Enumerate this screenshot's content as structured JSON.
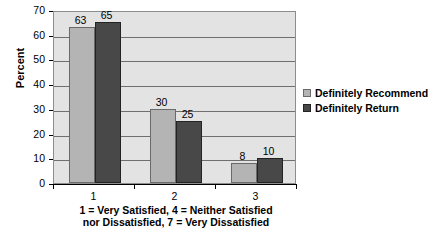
{
  "chart_data": {
    "type": "bar",
    "title": "",
    "xlabel": "1 = Very Satisfied, 4 = Neither Satisfied nor Dissatisfied, 7 = Very Dissatisfied",
    "xlabel_line1": "1 = Very Satisfied, 4 = Neither Satisfied",
    "xlabel_line2": "nor Dissatisfied, 7 = Very Dissatisfied",
    "ylabel": "Percent",
    "categories": [
      "1",
      "2",
      "3"
    ],
    "series": [
      {
        "name": "Definitely Recommend",
        "color": "#b4b4b4",
        "values": [
          63,
          30,
          8
        ]
      },
      {
        "name": "Definitely Return",
        "color": "#484848",
        "values": [
          65,
          25,
          10
        ]
      }
    ],
    "ylim": [
      0,
      70
    ],
    "yticks": [
      0,
      10,
      20,
      30,
      40,
      50,
      60,
      70
    ],
    "ytick_labels": [
      "0",
      "10",
      "20",
      "30",
      "40",
      "50",
      "60",
      "70"
    ],
    "grid": true,
    "grid_axis": "y",
    "legend_position": "right",
    "plot_background": "#e3e3e3",
    "figure_background": "#ffffff"
  }
}
